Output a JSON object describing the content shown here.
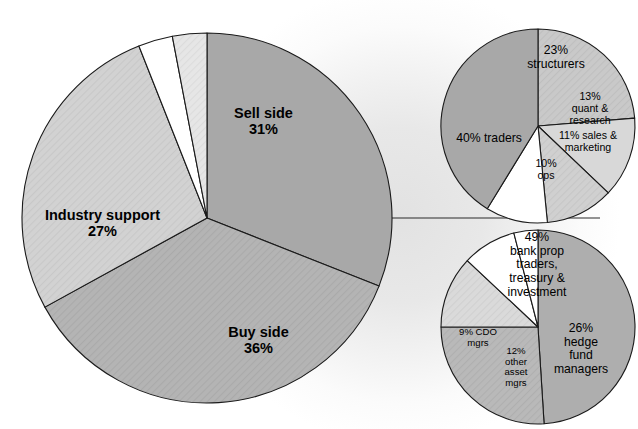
{
  "figure": {
    "title": "",
    "background_color": "#ffffff",
    "glow_color": "#e2e2e2",
    "outline_color": "#1a1a1a"
  },
  "chart_data": [
    {
      "type": "pie",
      "id": "main-pie",
      "title": "",
      "role": "overall market participants",
      "center": [
        207,
        218
      ],
      "radius": 185,
      "start_angle_deg": 0,
      "direction": "clockwise",
      "labels": [
        "Sell side",
        "Buy side",
        "Industry support",
        "",
        ""
      ],
      "values": [
        31,
        36,
        27,
        3,
        3
      ],
      "value_suffix": "%",
      "colors": [
        "#a8a8a8",
        "#b4b4b4",
        "#d2d2d2",
        "#ffffff",
        "#e4e4e4"
      ],
      "slices": [
        {
          "name": "sell-side",
          "label_line1": "Sell side",
          "label_line2": "31%",
          "value": 31,
          "color": "#a8a8a8",
          "hatch": false,
          "label_x": 263,
          "label_y": 100
        },
        {
          "name": "buy-side",
          "label_line1": "Buy side",
          "label_line2": "36%",
          "value": 36,
          "color": "#b4b4b4",
          "hatch": true,
          "label_x": 255,
          "label_y": 318
        },
        {
          "name": "industry-support",
          "label_line1": "Industry support",
          "label_line2": "27%",
          "value": 27,
          "color": "#d2d2d2",
          "hatch": true,
          "label_x": 98,
          "label_y": 200
        },
        {
          "name": "unlabeled-white-wedge",
          "label_line1": "",
          "label_line2": "",
          "value": 3,
          "color": "#ffffff",
          "hatch": false,
          "label_x": 0,
          "label_y": 0
        },
        {
          "name": "unlabeled-light-wedge",
          "label_line1": "",
          "label_line2": "",
          "value": 3,
          "color": "#e6e6e6",
          "hatch": true,
          "label_x": 0,
          "label_y": 0
        }
      ]
    },
    {
      "type": "pie",
      "id": "sell-side-breakdown-pie",
      "title": "",
      "role": "sell side breakdown",
      "center": [
        538,
        126
      ],
      "radius": 97,
      "start_angle_deg": 0,
      "direction": "clockwise",
      "labels": [
        "structurers",
        "quant & research",
        "sales & marketing",
        "ops",
        "traders"
      ],
      "values": [
        23,
        13,
        11,
        10,
        40
      ],
      "value_suffix": "%",
      "colors": [
        "#c9c9c9",
        "#d8d8d8",
        "#d0d0d0",
        "#ffffff",
        "#a8a8a8"
      ],
      "slices": [
        {
          "name": "structurers",
          "label_line1": "23%",
          "label_line2": "structurers",
          "label_line3": "",
          "label_line4": "",
          "value": 23,
          "color": "#c9c9c9",
          "hatch": true,
          "label_x": 556,
          "label_y": 48,
          "size": "sub"
        },
        {
          "name": "quant-and-research",
          "label_line1": "13%",
          "label_line2": "quant &",
          "label_line3": "research",
          "label_line4": "",
          "value": 13,
          "color": "#d8d8d8",
          "hatch": false,
          "label_x": 589,
          "label_y": 88,
          "size": "sub-sm"
        },
        {
          "name": "sales-and-marketing",
          "label_line1": "11% sales &",
          "label_line2": "marketing",
          "label_line3": "",
          "label_line4": "",
          "value": 11,
          "color": "#d0d0d0",
          "hatch": true,
          "label_x": 589,
          "label_y": 131,
          "size": "sub-sm"
        },
        {
          "name": "ops",
          "label_line1": "10%",
          "label_line2": "ops",
          "label_line3": "",
          "label_line4": "",
          "value": 10,
          "color": "#ffffff",
          "hatch": false,
          "label_x": 548,
          "label_y": 158,
          "size": "sub-sm"
        },
        {
          "name": "traders",
          "label_line1": "40% traders",
          "label_line2": "",
          "label_line3": "",
          "label_line4": "",
          "value": 40,
          "color": "#a8a8a8",
          "hatch": false,
          "label_x": 487,
          "label_y": 139,
          "size": "sub"
        }
      ]
    },
    {
      "type": "pie",
      "id": "buy-side-breakdown-pie",
      "title": "",
      "role": "buy side breakdown",
      "center": [
        538,
        327
      ],
      "radius": 97,
      "start_angle_deg": 0,
      "direction": "clockwise",
      "labels": [
        "bank prop traders, treasury & investment",
        "hedge fund managers",
        "other asset mgrs",
        "CDO mgrs",
        ""
      ],
      "values": [
        49,
        26,
        12,
        9,
        4
      ],
      "value_suffix": "%",
      "colors": [
        "#aeaeae",
        "#b9b9b9",
        "#dadada",
        "#ffffff",
        "#ffffff"
      ],
      "slices": [
        {
          "name": "bank-prop-traders-treasury-investment",
          "label_line1": "49%",
          "label_line2": "bank prop",
          "label_line3": "traders,",
          "label_line4": "treasury &",
          "label_line5": "investment",
          "value": 49,
          "color": "#aeaeae",
          "hatch": false,
          "label_x": 535,
          "label_y": 236,
          "size": "sub"
        },
        {
          "name": "hedge-fund-managers",
          "label_line1": "26%",
          "label_line2": "hedge",
          "label_line3": "fund",
          "label_line4": "managers",
          "label_line5": "",
          "value": 26,
          "color": "#b9b9b9",
          "hatch": true,
          "label_x": 578,
          "label_y": 328,
          "size": "sub"
        },
        {
          "name": "other-asset-mgrs",
          "label_line1": "12%",
          "label_line2": "other",
          "label_line3": "asset",
          "label_line4": "mgrs",
          "label_line5": "",
          "value": 12,
          "color": "#dadada",
          "hatch": true,
          "label_x": 514,
          "label_y": 348,
          "size": "sub-xs"
        },
        {
          "name": "cdo-mgrs",
          "label_line1": "9%  CDO",
          "label_line2": "mgrs",
          "label_line3": "",
          "label_line4": "",
          "label_line5": "",
          "value": 9,
          "color": "#ffffff",
          "hatch": false,
          "label_x": 478,
          "label_y": 328,
          "size": "sub-xs"
        },
        {
          "name": "unlabeled-white-wedge",
          "label_line1": "",
          "label_line2": "",
          "label_line3": "",
          "label_line4": "",
          "label_line5": "",
          "value": 4,
          "color": "#ffffff",
          "hatch": false,
          "label_x": 0,
          "label_y": 0,
          "size": "sub-xs"
        }
      ]
    }
  ],
  "connectors": {
    "description": "horizontal leader line from main pie center to the breakdown pies",
    "from_x": 207,
    "from_y": 218,
    "to_x": 600,
    "to_y": 218
  }
}
